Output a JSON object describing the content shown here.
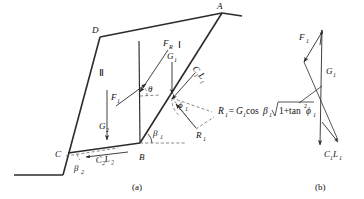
{
  "figure": {
    "title_a": "(a)",
    "title_b": "(b)",
    "panel_a": {
      "vertices": [
        {
          "name": "A",
          "label": "A"
        },
        {
          "name": "D",
          "label": "D"
        },
        {
          "name": "B",
          "label": "B"
        },
        {
          "name": "C",
          "label": "C"
        }
      ],
      "blocks": [
        {
          "name": "block-one",
          "label": "Ⅰ"
        },
        {
          "name": "block-two",
          "label": "Ⅱ"
        }
      ],
      "forces": [
        {
          "name": "force-F-upper",
          "base": "F",
          "sub": "R"
        },
        {
          "name": "force-F-lower",
          "base": "F",
          "sub": "1"
        },
        {
          "name": "weight-G1",
          "base": "G",
          "sub": "1"
        },
        {
          "name": "weight-G2",
          "base": "G",
          "sub": "2"
        },
        {
          "name": "cohesion-C1L1",
          "base": "C",
          "sub": "1",
          "base2": "L",
          "sub2": "1"
        },
        {
          "name": "cohesion-C2L2",
          "base": "C",
          "sub": "2",
          "base2": "L",
          "sub2": "2"
        },
        {
          "name": "reaction-R1",
          "base": "R",
          "sub": "1"
        }
      ],
      "angles": [
        {
          "name": "angle-theta",
          "base": "θ",
          "sub": ""
        },
        {
          "name": "angle-phi1",
          "base": "ϕ",
          "sub": "1"
        },
        {
          "name": "angle-beta1",
          "base": "β",
          "sub": "1"
        },
        {
          "name": "angle-beta2",
          "base": "β",
          "sub": "2"
        }
      ],
      "equation": {
        "lhs": "R",
        "lhs_sub": "1",
        "eq": "=",
        "rhs_G": "G",
        "rhs_G_sub": "1",
        "cos": "cos",
        "beta": "β",
        "beta_sub": "1",
        "radicand_prefix": "1+tan",
        "radicand_exp": "2",
        "radicand_phi": "ϕ",
        "radicand_phi_sub": "1"
      }
    },
    "panel_b": {
      "force_polygon": [
        {
          "name": "vector-F1",
          "base": "F",
          "sub": "1"
        },
        {
          "name": "vector-G1",
          "base": "G",
          "sub": "1"
        },
        {
          "name": "vector-C1L1",
          "base": "C",
          "sub": "1",
          "base2": "L",
          "sub2": "1"
        }
      ]
    }
  },
  "colors": {
    "stroke": "#2b2b2b",
    "dashed": "#555555",
    "text": "#111111",
    "background": "#ffffff"
  }
}
